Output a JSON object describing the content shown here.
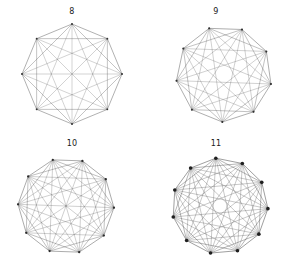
{
  "figure": {
    "background_color": "#ffffff",
    "top_caption": "",
    "panel_grid": {
      "rows": 2,
      "cols": 2
    }
  },
  "panels": [
    {
      "id": "panel-8",
      "title": "8",
      "n": 8,
      "rotation_deg": -90,
      "cx": 72,
      "cy": 58,
      "r": 50,
      "edge_color": "#555555",
      "node_color": "#333333",
      "node_radius": 0.9,
      "edge_width": 0.5
    },
    {
      "id": "panel-9",
      "title": "9",
      "n": 9,
      "rotation_deg": -68,
      "cx": 80,
      "cy": 58,
      "r": 48,
      "edge_color": "#4f4f4f",
      "node_color": "#303030",
      "node_radius": 1.0,
      "edge_width": 0.5
    },
    {
      "id": "panel-10",
      "title": "10",
      "n": 10,
      "rotation_deg": -106,
      "cx": 66,
      "cy": 58,
      "r": 48,
      "edge_color": "#4a4a4a",
      "node_color": "#2b2b2b",
      "node_radius": 1.1,
      "edge_width": 0.5
    },
    {
      "id": "panel-11",
      "title": "11",
      "n": 11,
      "rotation_deg": -95,
      "cx": 76,
      "cy": 58,
      "r": 48,
      "edge_color": "#3f3f3f",
      "node_color": "#1f1f1f",
      "node_radius": 1.8,
      "edge_width": 0.55
    }
  ],
  "chart_data": {
    "type": "diagram",
    "diagram_kind": "complete-graph-circular-layout",
    "title": "",
    "panel_titles": [
      "8",
      "9",
      "10",
      "11"
    ],
    "graphs": [
      {
        "label": "8",
        "vertices": 8,
        "edges": 28
      },
      {
        "label": "9",
        "vertices": 9,
        "edges": 36
      },
      {
        "label": "10",
        "vertices": 10,
        "edges": 45
      },
      {
        "label": "11",
        "vertices": 11,
        "edges": 55
      }
    ]
  }
}
